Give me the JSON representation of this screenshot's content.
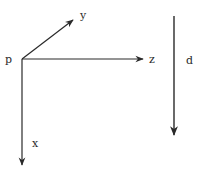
{
  "diagram": {
    "type": "coordinate-axes",
    "origin": {
      "label": "p",
      "x": 22,
      "y": 59
    },
    "axes": [
      {
        "name": "y",
        "label": "y",
        "from": [
          22,
          59
        ],
        "to": [
          73,
          20
        ],
        "label_pos": [
          80,
          19
        ]
      },
      {
        "name": "z",
        "label": "z",
        "from": [
          22,
          59
        ],
        "to": [
          143,
          59
        ],
        "label_pos": [
          149,
          63
        ]
      },
      {
        "name": "x",
        "label": "x",
        "from": [
          22,
          59
        ],
        "to": [
          22,
          165
        ],
        "label_pos": [
          32,
          147
        ]
      }
    ],
    "direction_vector": {
      "label": "d",
      "from": [
        174,
        16
      ],
      "to": [
        174,
        135
      ],
      "label_pos": [
        186,
        64
      ]
    },
    "colors": {
      "stroke": "#2a2a2a",
      "background": "#ffffff"
    }
  }
}
